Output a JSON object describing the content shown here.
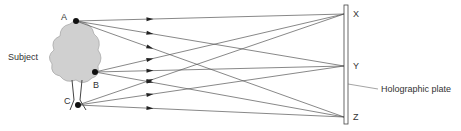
{
  "labels": {
    "subject": "Subject",
    "plate": "Holographic plate"
  },
  "source_points": [
    {
      "id": "A",
      "label": "A"
    },
    {
      "id": "B",
      "label": "B"
    },
    {
      "id": "C",
      "label": "C"
    }
  ],
  "plate_points": [
    {
      "id": "X",
      "label": "X"
    },
    {
      "id": "Y",
      "label": "Y"
    },
    {
      "id": "Z",
      "label": "Z"
    }
  ],
  "rays": [
    {
      "from": "A",
      "to": "X"
    },
    {
      "from": "A",
      "to": "Y"
    },
    {
      "from": "A",
      "to": "Z"
    },
    {
      "from": "B",
      "to": "X"
    },
    {
      "from": "B",
      "to": "Y"
    },
    {
      "from": "B",
      "to": "Z"
    },
    {
      "from": "C",
      "to": "X"
    },
    {
      "from": "C",
      "to": "Y"
    },
    {
      "from": "C",
      "to": "Z"
    }
  ],
  "colors": {
    "line": "#555555",
    "tree": "#c8c8c8",
    "text": "#333333"
  }
}
